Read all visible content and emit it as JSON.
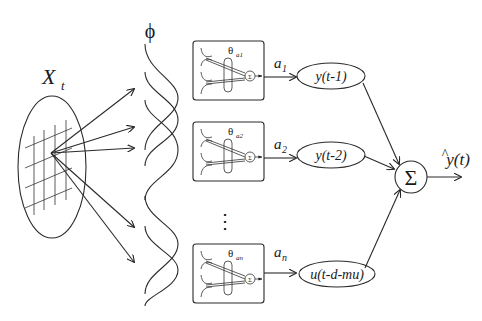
{
  "diagram": {
    "input": {
      "label": "X",
      "subscript": "t"
    },
    "basis": {
      "label": "ϕ"
    },
    "networks": [
      {
        "theta": "θ",
        "theta_sub": "a1",
        "weight": "a",
        "weight_sub": "1",
        "sum_symbol": "Σ",
        "regressor": "y(t-1)"
      },
      {
        "theta": "θ",
        "theta_sub": "a2",
        "weight": "a",
        "weight_sub": "2",
        "sum_symbol": "Σ",
        "regressor": "y(t-2)"
      },
      {
        "theta": "θ",
        "theta_sub": "an",
        "weight": "a",
        "weight_sub": "n",
        "sum_symbol": "Σ",
        "regressor": "u(t-d-mu)"
      }
    ],
    "ellipsis": "⋮",
    "output_sum": {
      "symbol": "Σ"
    },
    "output": {
      "label": "y(t)",
      "hat": "^"
    }
  }
}
